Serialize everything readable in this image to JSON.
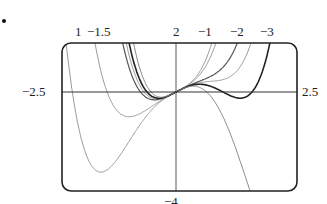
{
  "chart_data": {
    "type": "line",
    "title": "",
    "xlabel": "",
    "ylabel": "",
    "xlim": [
      -2.5,
      2.5
    ],
    "ylim": [
      -4,
      2
    ],
    "x_tick_labels": [
      "-2.5",
      "2.5"
    ],
    "y_tick_labels": [
      "-4"
    ],
    "grid": false,
    "legend_position": "curve labels above plot",
    "series": [
      {
        "name": "1",
        "label_x": 79,
        "shade": "#9a9a9a",
        "width": 1.0
      },
      {
        "name": "-1.5",
        "label_x": 105,
        "shade": "#9a9a9a",
        "width": 1.0
      },
      {
        "name": "2",
        "label_x": 176,
        "shade": "#9a9a9a",
        "width": 1.0
      },
      {
        "name": "-1",
        "label_x": 210,
        "shade": "#555555",
        "width": 1.2
      },
      {
        "name": "-2",
        "label_x": 240,
        "shade": "#222222",
        "width": 1.6
      },
      {
        "name": "-3",
        "label_x": 268,
        "shade": "#888888",
        "width": 1.0
      }
    ],
    "annotations": [
      "1",
      "-1.5",
      "2",
      "-1",
      "-2",
      "-3"
    ]
  },
  "labels": {
    "left": "−2.5",
    "right": "2.5",
    "bottom": "−4",
    "top": [
      "1",
      "−1.5",
      "2",
      "−1",
      "−2",
      "−3"
    ]
  }
}
